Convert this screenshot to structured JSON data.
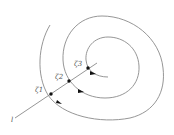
{
  "diagram": {
    "type": "spiral-with-transversal",
    "line_label": "l",
    "points": [
      {
        "label": "ζ1",
        "x": 51,
        "y": 94
      },
      {
        "label": "ζ2",
        "x": 69,
        "y": 81
      },
      {
        "label": "ζ3",
        "x": 88,
        "y": 68
      }
    ],
    "colors": {
      "curve": "#8a8a8a",
      "point": "#111111",
      "label": "#555555"
    }
  }
}
